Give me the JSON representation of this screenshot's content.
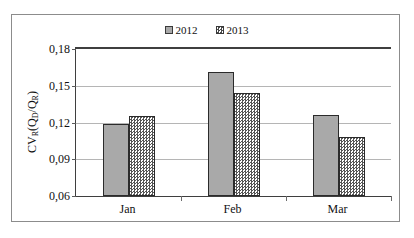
{
  "chart_data": {
    "type": "bar",
    "title": "",
    "subtitle": "",
    "categories": [
      "Jan",
      "Feb",
      "Mar"
    ],
    "series": [
      {
        "name": "2012",
        "values": [
          0.119,
          0.161,
          0.126
        ],
        "fill": "solid-gray",
        "color": "#a9a9a9"
      },
      {
        "name": "2013",
        "values": [
          0.125,
          0.144,
          0.108
        ],
        "fill": "checkered",
        "color": "#555555"
      }
    ],
    "xlabel": "",
    "ylabel": "CV_R(Q_D/Q_R)",
    "ylim": [
      0.06,
      0.18
    ],
    "yticks": [
      0.06,
      0.09,
      0.12,
      0.15,
      0.18
    ],
    "ytick_labels": [
      "0,06",
      "0,09",
      "0,12",
      "0,15",
      "0,18"
    ],
    "grid": true,
    "legend_position": "top-center",
    "decimal_separator": ","
  },
  "ylabel_parts": {
    "main1": "CV",
    "sub1": "R",
    "open": "(Q",
    "sub2": "D",
    "slash": "/Q",
    "sub3": "R",
    "close": ")"
  },
  "colors": {
    "series_2012": "#a9a9a9",
    "series_2013_pattern": "#555555",
    "gridline": "#b5b5b5",
    "axis": "#3f3f3f",
    "frame": "#8c8c8c",
    "text": "#111111",
    "background": "#ffffff"
  }
}
